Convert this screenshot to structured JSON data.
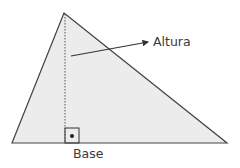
{
  "diagram": {
    "type": "triangle-height",
    "labels": {
      "height": "Altura",
      "base": "Base"
    },
    "colors": {
      "fill": "#ececec",
      "stroke": "#444444",
      "text": "#3a3a3a"
    },
    "vertices": {
      "apex": [
        64,
        13
      ],
      "base_left": [
        12,
        143
      ],
      "base_right": [
        227,
        143
      ]
    },
    "height_foot": [
      65,
      143
    ]
  }
}
